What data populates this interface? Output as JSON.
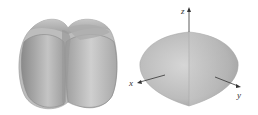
{
  "figure": {
    "left_solid": {
      "description": "Intersecting cylinders solid (rounded lobed shape)",
      "fill_light": "#d9d9d9",
      "fill_mid": "#b3b3b3",
      "fill_dark": "#8c8c8c"
    },
    "right_solid": {
      "description": "Pointed solid with axes",
      "fill_light": "#d6d6d6",
      "fill_dark": "#9a9a9a"
    },
    "axes": {
      "x_label": "x",
      "y_label": "y",
      "z_label": "z",
      "color": "#333333"
    }
  }
}
